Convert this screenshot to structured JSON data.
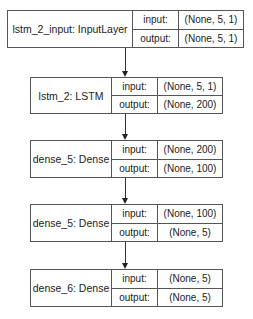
{
  "nodes": [
    {
      "name": "lstm_2_input: InputLayer",
      "input_label": "input:",
      "output_label": "output:",
      "input": "(None, 5, 1)",
      "output": "(None, 5, 1)"
    },
    {
      "name": "lstm_2: LSTM",
      "input_label": "input:",
      "output_label": "output:",
      "input": "(None, 5, 1)",
      "output": "(None, 200)"
    },
    {
      "name": "dense_5: Dense",
      "input_label": "input:",
      "output_label": "output:",
      "input": "(None, 200)",
      "output": "(None, 100)"
    },
    {
      "name": "dense_5: Dense",
      "input_label": "input:",
      "output_label": "output:",
      "input": "(None, 100)",
      "output": "(None, 5)"
    },
    {
      "name": "dense_6: Dense",
      "input_label": "input:",
      "output_label": "output:",
      "input": "(None, 5)",
      "output": "(None, 5)"
    }
  ],
  "edges": [
    [
      0,
      1
    ],
    [
      1,
      2
    ],
    [
      2,
      3
    ],
    [
      3,
      4
    ]
  ]
}
